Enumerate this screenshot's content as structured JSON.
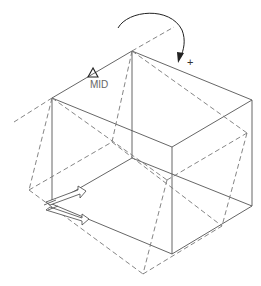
{
  "drawing": {
    "title": "Rotate box about midpoint axis",
    "snap_label": "MID",
    "rotation_sign": "+",
    "colors": {
      "solid_line": "#555555",
      "dashed_line": "#777777",
      "arrow": "#222222",
      "background": "#ffffff"
    },
    "solid_box": {
      "top": [
        [
          52,
          98
        ],
        [
          132,
          51
        ],
        [
          252,
          100
        ],
        [
          172,
          147
        ]
      ],
      "bottom": [
        [
          52,
          204
        ],
        [
          132,
          158
        ],
        [
          252,
          206
        ],
        [
          172,
          254
        ]
      ]
    },
    "rotated_box_dashed": true,
    "icons": [
      "rotation-arrow-icon",
      "midpoint-snap-icon",
      "ucs-icon"
    ]
  }
}
